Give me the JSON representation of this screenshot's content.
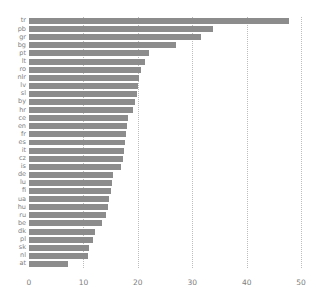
{
  "chart_data": {
    "type": "bar",
    "orientation": "horizontal",
    "title": "",
    "xlabel": "",
    "ylabel": "",
    "xlim": [
      0,
      52
    ],
    "xticks": [
      0,
      10,
      20,
      30,
      40,
      50
    ],
    "grid": true,
    "legend": false,
    "bar_color": "#8c8c8c",
    "grid_color": "#bdbdbd",
    "tick_color": "#7d7d7d",
    "categories": [
      "tr",
      "pb",
      "gr",
      "bg",
      "pt",
      "lt",
      "ro",
      "nlr",
      "lv",
      "sl",
      "by",
      "hr",
      "ce",
      "en",
      "fr",
      "es",
      "it",
      "cz",
      "is",
      "de",
      "lu",
      "fi",
      "ua",
      "hu",
      "ru",
      "be",
      "dk",
      "pl",
      "sk",
      "nl",
      "at"
    ],
    "values": [
      47.7,
      33.8,
      31.6,
      27.0,
      22.0,
      21.4,
      20.5,
      20.3,
      20.0,
      19.8,
      19.5,
      19.2,
      18.2,
      18.0,
      17.9,
      17.6,
      17.4,
      17.2,
      16.9,
      15.4,
      15.2,
      15.0,
      14.7,
      14.5,
      14.2,
      13.4,
      12.2,
      11.8,
      11.0,
      10.8,
      7.2
    ]
  }
}
